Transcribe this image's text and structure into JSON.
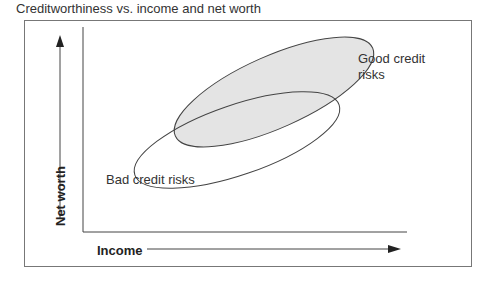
{
  "title": "Creditworthiness vs. income and net worth",
  "axes": {
    "x_label": "Income",
    "y_label": "Net worth"
  },
  "regions": [
    {
      "name": "good",
      "label_line1": "Good credit",
      "label_line2": "risks",
      "fill": "#e4e4e4"
    },
    {
      "name": "bad",
      "label": "Bad credit risks",
      "fill": "none"
    }
  ],
  "colors": {
    "line": "#444444",
    "frame": "#777777",
    "good_fill": "#e4e4e4"
  }
}
